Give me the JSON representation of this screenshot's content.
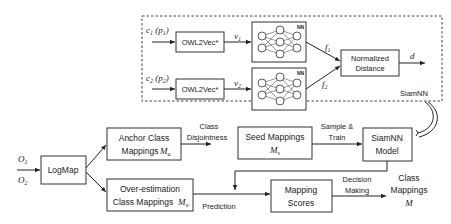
{
  "diagram": {
    "siamnn_panel": {
      "label": "SiamNN",
      "inputs": [
        {
          "class": "c",
          "class_sub": "1",
          "prop": "p",
          "prop_sub": "1"
        },
        {
          "class": "c",
          "class_sub": "2",
          "prop": "p",
          "prop_sub": "2"
        }
      ],
      "encoder_label": "OWL2Vec*",
      "vectors": [
        {
          "sym": "v",
          "sub": "1"
        },
        {
          "sym": "v",
          "sub": "2"
        }
      ],
      "nn_label": "NN",
      "features": [
        {
          "sym": "f",
          "sub": "1"
        },
        {
          "sym": "f",
          "sub": "2"
        }
      ],
      "distance_box": {
        "line1": "Normalized",
        "line2": "Distance"
      },
      "output": "d"
    },
    "pipeline": {
      "inputs": [
        {
          "sym": "O",
          "sub": "1"
        },
        {
          "sym": "O",
          "sub": "2"
        }
      ],
      "logmap": "LogMap",
      "anchor": {
        "line1": "Anchor Class",
        "line2": "Mappings",
        "sym": "M",
        "sub": "a"
      },
      "overestimation": {
        "line1": "Over-estimation",
        "line2": "Class Mappings",
        "sym": "M",
        "sub": "o"
      },
      "edge_disjointness": {
        "line1": "Class",
        "line2": "Disjointness"
      },
      "seed": {
        "line1": "Seed Mappings",
        "sym": "M",
        "sub": "s"
      },
      "edge_sample_train": {
        "line1": "Sample &",
        "line2": "Train"
      },
      "siamnn_model": {
        "line1": "SiamNN",
        "line2": "Model"
      },
      "edge_prediction": "Prediction",
      "scores": {
        "line1": "Mapping",
        "line2": "Scores"
      },
      "edge_decision": {
        "line1": "Decision",
        "line2": "Making"
      },
      "output": {
        "line1": "Class",
        "line2": "Mappings",
        "sym": "M"
      }
    }
  }
}
